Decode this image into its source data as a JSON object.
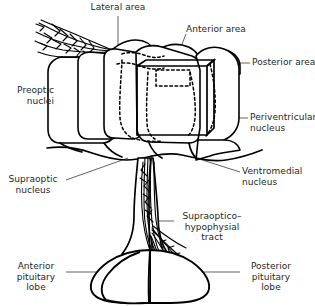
{
  "figure": {
    "ink_color": "#000000",
    "text_color": "#262626",
    "background_color": "#ffffff"
  },
  "labels": {
    "lateral_area": "Lateral area",
    "anterior_area": "Anterior area",
    "posterior_area": "Posterior area",
    "preoptic_nuclei": "Preoptic\nnuclei",
    "periventricular_nucleus": "Periventricular\nnucleus",
    "supraoptic_nucleus": "Supraoptic\nnucleus",
    "ventromedial_nucleus": "Ventromedial\nnucleus",
    "supraoptico_hypophysial_tract": "Supraoptico–\nhypophysial\ntract",
    "anterior_pituitary_lobe": "Anterior\npituitary\nlobe",
    "posterior_pituitary_lobe": "Posterior\npituitary\nlobe"
  }
}
